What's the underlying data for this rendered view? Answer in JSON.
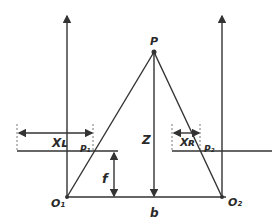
{
  "diagram": {
    "labels": {
      "point": "P",
      "depth": "Z",
      "focal": "f",
      "baseline": "b",
      "left_origin": "O₁",
      "right_origin": "O₂",
      "left_proj": "P₁",
      "right_proj": "P₂",
      "left_disp": "Xʟ",
      "right_disp": "Xʀ"
    },
    "colors": {
      "line": "#333333",
      "background": "#ffffff"
    }
  }
}
